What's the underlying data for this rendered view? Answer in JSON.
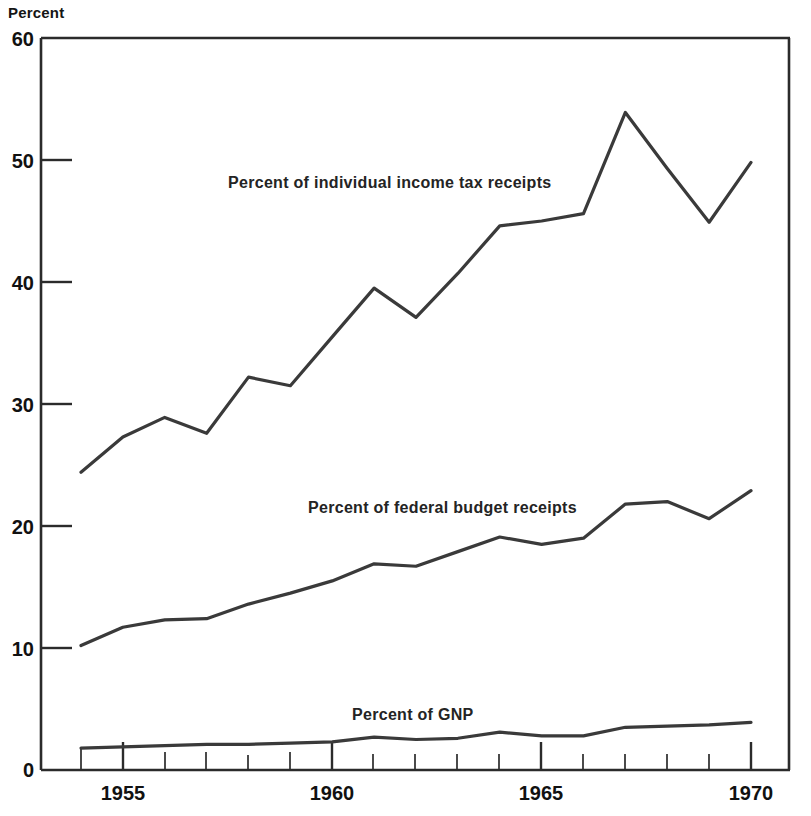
{
  "chart_data": {
    "type": "line",
    "title": "",
    "subtitle": "",
    "ylabel": "Percent",
    "xlabel": "",
    "ylim": [
      0,
      60
    ],
    "xlim": [
      1954,
      1970
    ],
    "grid": false,
    "legend_position": "inline-annotations",
    "yticks": [
      0,
      10,
      20,
      30,
      40,
      50,
      60
    ],
    "ytick_labels": [
      "0",
      "10",
      "20",
      "30",
      "40",
      "50",
      "60"
    ],
    "xticks": [
      1955,
      1960,
      1965,
      1970
    ],
    "xtick_labels": [
      "1955",
      "1960",
      "1965",
      "1970"
    ],
    "x_minor_ticks": [
      1954,
      1956,
      1957,
      1958,
      1959,
      1961,
      1962,
      1963,
      1964,
      1966,
      1967,
      1968,
      1969
    ],
    "x": [
      1954,
      1955,
      1956,
      1957,
      1958,
      1959,
      1960,
      1961,
      1962,
      1963,
      1964,
      1965,
      1966,
      1967,
      1968,
      1969,
      1970
    ],
    "series": [
      {
        "name": "Percent of individual income tax receipts",
        "label": "Percent of individual income tax receipts",
        "color": "#3a3a3a",
        "values": [
          24.4,
          27.3,
          28.9,
          27.6,
          32.2,
          31.5,
          35.5,
          39.5,
          37.1,
          40.7,
          44.6,
          45.0,
          45.6,
          53.9,
          49.3,
          44.9,
          49.8
        ]
      },
      {
        "name": "Percent of federal budget receipts",
        "label": "Percent of federal budget receipts",
        "color": "#3a3a3a",
        "values": [
          10.2,
          11.7,
          12.3,
          12.4,
          13.6,
          14.5,
          15.5,
          16.9,
          16.7,
          17.9,
          19.1,
          18.5,
          19.0,
          21.8,
          22.0,
          20.6,
          22.9
        ]
      },
      {
        "name": "Percent of GNP",
        "label": "Percent of GNP",
        "color": "#3a3a3a",
        "values": [
          1.8,
          1.9,
          2.0,
          2.1,
          2.1,
          2.2,
          2.3,
          2.7,
          2.5,
          2.6,
          3.1,
          2.8,
          2.8,
          3.5,
          3.6,
          3.7,
          3.9
        ]
      }
    ],
    "annotations": [
      {
        "text": "Percent of individual income tax receipts",
        "x": 1957.9,
        "y": 46.5
      },
      {
        "text": "Percent of federal budget receipts",
        "x": 1959.5,
        "y": 22.5
      },
      {
        "text": "Percent of GNP",
        "x": 1961.0,
        "y": 6.5
      }
    ]
  }
}
